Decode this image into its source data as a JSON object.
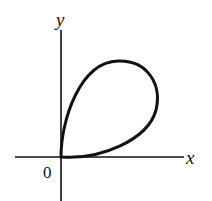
{
  "diagram": {
    "type": "plane-curve",
    "axes": {
      "x_label": "x",
      "y_label": "y",
      "origin_label": "0"
    },
    "colors": {
      "stroke": "#111111",
      "background": "#ffffff"
    }
  }
}
